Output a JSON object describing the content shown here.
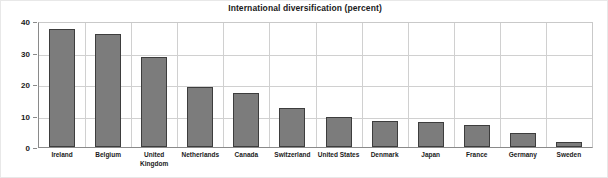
{
  "chart_data": {
    "type": "bar",
    "title": "International diversification (percent)",
    "xlabel": "",
    "ylabel": "",
    "ylim": [
      0,
      40
    ],
    "yticks": [
      0,
      10,
      20,
      30,
      40
    ],
    "grid": "both",
    "legend": "none",
    "bar_color": "#7c7c7c",
    "bar_edge_color": "#3d3d3d",
    "categories": [
      "Ireland",
      "Belgium",
      "United Kingdom",
      "Netherlands",
      "Canada",
      "Switzerland",
      "United States",
      "Denmark",
      "Japan",
      "France",
      "Germany",
      "Sweden"
    ],
    "category_lines": [
      [
        "Ireland"
      ],
      [
        "Belgium"
      ],
      [
        "United",
        "Kingdom"
      ],
      [
        "Netherlands"
      ],
      [
        "Canada"
      ],
      [
        "Switzerland"
      ],
      [
        "United States"
      ],
      [
        "Denmark"
      ],
      [
        "Japan"
      ],
      [
        "France"
      ],
      [
        "Germany"
      ],
      [
        "Sweden"
      ]
    ],
    "values": [
      37.5,
      36.0,
      28.5,
      19.0,
      17.0,
      12.5,
      9.5,
      8.2,
      8.0,
      7.0,
      4.3,
      1.5
    ]
  }
}
